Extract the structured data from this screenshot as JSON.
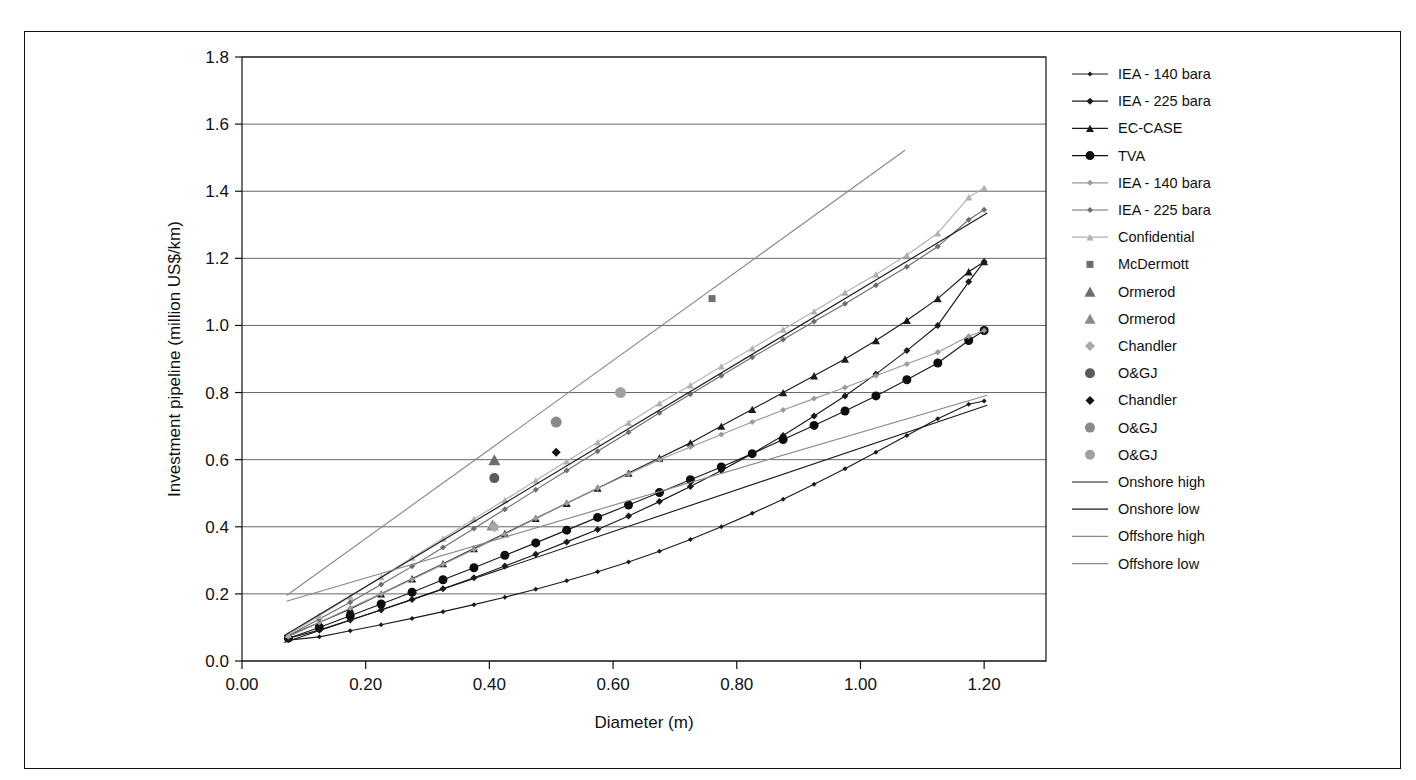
{
  "chart_data": {
    "type": "line",
    "title": "",
    "xlabel": "Diameter (m)",
    "ylabel": "Investment pipeline (million US$/km)",
    "xlim": [
      0.0,
      1.3
    ],
    "ylim": [
      0.0,
      1.8
    ],
    "xticks": [
      "0.00",
      "0.20",
      "0.40",
      "0.60",
      "0.80",
      "1.00",
      "1.20"
    ],
    "xtick_values": [
      0.0,
      0.2,
      0.4,
      0.6,
      0.8,
      1.0,
      1.2
    ],
    "yticks": [
      "0.0",
      "0.2",
      "0.4",
      "0.6",
      "0.8",
      "1.0",
      "1.2",
      "1.4",
      "1.6",
      "1.8"
    ],
    "ytick_values": [
      0.0,
      0.2,
      0.4,
      0.6,
      0.8,
      1.0,
      1.2,
      1.4,
      1.6,
      1.8
    ],
    "grid": "horizontal",
    "legend_position": "right",
    "series": [
      {
        "name": "IEA - 140 bara",
        "style": "line-marker",
        "marker": "diamond",
        "marker_size": 5,
        "color": "#1a1a1a",
        "line_color": "#1a1a1a",
        "x": [
          0.075,
          0.125,
          0.175,
          0.225,
          0.275,
          0.325,
          0.375,
          0.425,
          0.475,
          0.525,
          0.575,
          0.625,
          0.675,
          0.725,
          0.775,
          0.825,
          0.875,
          0.925,
          0.975,
          1.025,
          1.075,
          1.125,
          1.175,
          1.2
        ],
        "y": [
          0.062,
          0.072,
          0.09,
          0.108,
          0.127,
          0.147,
          0.168,
          0.19,
          0.214,
          0.239,
          0.266,
          0.295,
          0.327,
          0.362,
          0.4,
          0.44,
          0.482,
          0.527,
          0.573,
          0.622,
          0.672,
          0.722,
          0.765,
          0.775
        ]
      },
      {
        "name": "IEA - 225 bara",
        "style": "line-marker",
        "marker": "diamond",
        "marker_size": 7,
        "color": "#1a1a1a",
        "line_color": "#1a1a1a",
        "x": [
          0.075,
          0.125,
          0.175,
          0.225,
          0.275,
          0.325,
          0.375,
          0.425,
          0.475,
          0.525,
          0.575,
          0.625,
          0.675,
          0.725,
          0.775,
          0.825,
          0.875,
          0.925,
          0.975,
          1.025,
          1.075,
          1.125,
          1.175,
          1.2
        ],
        "y": [
          0.068,
          0.092,
          0.122,
          0.152,
          0.183,
          0.215,
          0.248,
          0.283,
          0.318,
          0.355,
          0.392,
          0.432,
          0.475,
          0.52,
          0.568,
          0.618,
          0.672,
          0.73,
          0.79,
          0.855,
          0.925,
          1.0,
          1.13,
          1.19
        ]
      },
      {
        "name": "EC-CASE",
        "style": "line-marker",
        "marker": "triangle",
        "marker_size": 8,
        "color": "#1a1a1a",
        "line_color": "#1a1a1a",
        "x": [
          0.075,
          0.125,
          0.175,
          0.225,
          0.275,
          0.325,
          0.375,
          0.425,
          0.475,
          0.525,
          0.575,
          0.625,
          0.675,
          0.725,
          0.775,
          0.825,
          0.875,
          0.925,
          0.975,
          1.025,
          1.075,
          1.125,
          1.175,
          1.2
        ],
        "y": [
          0.075,
          0.115,
          0.155,
          0.2,
          0.245,
          0.29,
          0.335,
          0.38,
          0.425,
          0.47,
          0.515,
          0.56,
          0.605,
          0.65,
          0.7,
          0.75,
          0.8,
          0.85,
          0.9,
          0.955,
          1.015,
          1.08,
          1.16,
          1.19
        ]
      },
      {
        "name": "TVA",
        "style": "line-marker",
        "marker": "circle",
        "marker_size": 9,
        "color": "#0d0d0d",
        "line_color": "#1a1a1a",
        "x": [
          0.075,
          0.125,
          0.175,
          0.225,
          0.275,
          0.325,
          0.375,
          0.425,
          0.475,
          0.525,
          0.575,
          0.625,
          0.675,
          0.725,
          0.775,
          0.825,
          0.875,
          0.925,
          0.975,
          1.025,
          1.075,
          1.125,
          1.175,
          1.2
        ],
        "y": [
          0.068,
          0.1,
          0.135,
          0.17,
          0.205,
          0.242,
          0.278,
          0.315,
          0.352,
          0.39,
          0.428,
          0.465,
          0.502,
          0.54,
          0.578,
          0.618,
          0.66,
          0.702,
          0.745,
          0.79,
          0.838,
          0.888,
          0.955,
          0.985
        ]
      },
      {
        "name": "IEA - 140 bara",
        "style": "line-marker",
        "marker": "diamond",
        "marker_size": 6,
        "color": "#9a9a9a",
        "line_color": "#9a9a9a",
        "x": [
          0.075,
          0.125,
          0.175,
          0.225,
          0.275,
          0.325,
          0.375,
          0.425,
          0.475,
          0.525,
          0.575,
          0.625,
          0.675,
          0.725,
          0.775,
          0.825,
          0.875,
          0.925,
          0.975,
          1.025,
          1.075,
          1.125,
          1.175,
          1.2
        ],
        "y": [
          0.072,
          0.115,
          0.158,
          0.2,
          0.243,
          0.288,
          0.332,
          0.378,
          0.425,
          0.47,
          0.515,
          0.557,
          0.6,
          0.638,
          0.675,
          0.712,
          0.748,
          0.782,
          0.815,
          0.85,
          0.885,
          0.92,
          0.968,
          0.985
        ]
      },
      {
        "name": "IEA - 225 bara",
        "style": "line-marker",
        "marker": "diamond",
        "marker_size": 6,
        "color": "#6e6e6e",
        "line_color": "#6e6e6e",
        "x": [
          0.075,
          0.125,
          0.175,
          0.225,
          0.275,
          0.325,
          0.375,
          0.425,
          0.475,
          0.525,
          0.575,
          0.625,
          0.675,
          0.725,
          0.775,
          0.825,
          0.875,
          0.925,
          0.975,
          1.025,
          1.075,
          1.125,
          1.175,
          1.2
        ],
        "y": [
          0.075,
          0.125,
          0.175,
          0.228,
          0.282,
          0.338,
          0.395,
          0.452,
          0.51,
          0.568,
          0.625,
          0.682,
          0.74,
          0.795,
          0.85,
          0.905,
          0.958,
          1.012,
          1.065,
          1.12,
          1.175,
          1.235,
          1.315,
          1.345
        ]
      },
      {
        "name": "Confidential",
        "style": "line-marker",
        "marker": "triangle",
        "marker_size": 7,
        "color": "#b0b0b0",
        "line_color": "#b0b0b0",
        "x": [
          0.075,
          0.125,
          0.175,
          0.225,
          0.275,
          0.325,
          0.375,
          0.425,
          0.475,
          0.525,
          0.575,
          0.625,
          0.675,
          0.725,
          0.775,
          0.825,
          0.875,
          0.925,
          0.975,
          1.025,
          1.075,
          1.125,
          1.175,
          1.2
        ],
        "y": [
          0.078,
          0.135,
          0.192,
          0.25,
          0.308,
          0.365,
          0.423,
          0.48,
          0.538,
          0.595,
          0.652,
          0.71,
          0.768,
          0.822,
          0.878,
          0.932,
          0.988,
          1.042,
          1.098,
          1.152,
          1.21,
          1.275,
          1.382,
          1.41
        ]
      },
      {
        "name": "McDermott",
        "style": "scatter",
        "marker": "square",
        "marker_size": 7,
        "color": "#6e6e6e",
        "x": [
          0.76
        ],
        "y": [
          1.08
        ]
      },
      {
        "name": "Ormerod",
        "style": "scatter",
        "marker": "triangle",
        "marker_size": 12,
        "color": "#6e6e6e",
        "x": [
          0.408
        ],
        "y": [
          0.6
        ]
      },
      {
        "name": "Ormerod",
        "style": "scatter",
        "marker": "triangle",
        "marker_size": 12,
        "color": "#8a8a8a",
        "x": [
          0.405
        ],
        "y": [
          0.405
        ]
      },
      {
        "name": "Chandler",
        "style": "scatter",
        "marker": "diamond",
        "marker_size": 11,
        "color": "#a8a8a8",
        "x": [
          0.408
        ],
        "y": [
          0.4
        ]
      },
      {
        "name": "O&GJ",
        "style": "scatter",
        "marker": "circle",
        "marker_size": 10,
        "color": "#5a5a5a",
        "x": [
          0.408
        ],
        "y": [
          0.545
        ]
      },
      {
        "name": "Chandler",
        "style": "scatter",
        "marker": "diamond",
        "marker_size": 9,
        "color": "#111111",
        "x": [
          0.508
        ],
        "y": [
          0.622
        ]
      },
      {
        "name": "O&GJ",
        "style": "scatter",
        "marker": "circle",
        "marker_size": 11,
        "color": "#8a8a8a",
        "x": [
          0.508
        ],
        "y": [
          0.712
        ]
      },
      {
        "name": "O&GJ",
        "style": "scatter",
        "marker": "circle",
        "marker_size": 11,
        "color": "#a0a0a0",
        "x": [
          0.612
        ],
        "y": [
          0.8
        ]
      },
      {
        "name": "Onshore high",
        "style": "line",
        "marker": "none",
        "color": "#1a1a1a",
        "line_color": "#1a1a1a",
        "x": [
          0.068,
          1.205
        ],
        "y": [
          0.075,
          1.335
        ]
      },
      {
        "name": "Onshore low",
        "style": "line",
        "marker": "none",
        "color": "#1a1a1a",
        "line_color": "#1a1a1a",
        "x": [
          0.068,
          1.205
        ],
        "y": [
          0.055,
          0.762
        ]
      },
      {
        "name": "Offshore high",
        "style": "line",
        "marker": "none",
        "color": "#8a8a8a",
        "line_color": "#8a8a8a",
        "x": [
          0.072,
          1.072
        ],
        "y": [
          0.195,
          1.522
        ]
      },
      {
        "name": "Offshore low",
        "style": "line",
        "marker": "none",
        "color": "#8a8a8a",
        "line_color": "#8a8a8a",
        "x": [
          0.072,
          1.205
        ],
        "y": [
          0.178,
          0.792
        ]
      }
    ],
    "legend": [
      {
        "label": "IEA - 140 bara",
        "type": "line-marker",
        "marker": "diamond",
        "size": 5,
        "color": "#1a1a1a"
      },
      {
        "label": "IEA - 225 bara",
        "type": "line-marker",
        "marker": "diamond",
        "size": 7,
        "color": "#1a1a1a"
      },
      {
        "label": "EC-CASE",
        "type": "line-marker",
        "marker": "triangle",
        "size": 8,
        "color": "#1a1a1a"
      },
      {
        "label": "TVA",
        "type": "line-marker",
        "marker": "circle",
        "size": 9,
        "color": "#0d0d0d"
      },
      {
        "label": "IEA - 140 bara",
        "type": "line-marker",
        "marker": "diamond",
        "size": 6,
        "color": "#9a9a9a"
      },
      {
        "label": "IEA - 225 bara",
        "type": "line-marker",
        "marker": "diamond",
        "size": 6,
        "color": "#6e6e6e"
      },
      {
        "label": "Confidential",
        "type": "line-marker",
        "marker": "triangle",
        "size": 7,
        "color": "#b0b0b0"
      },
      {
        "label": "McDermott",
        "type": "marker",
        "marker": "square",
        "size": 7,
        "color": "#6e6e6e"
      },
      {
        "label": "Ormerod",
        "type": "marker",
        "marker": "triangle",
        "size": 11,
        "color": "#6e6e6e"
      },
      {
        "label": "Ormerod",
        "type": "marker",
        "marker": "triangle",
        "size": 11,
        "color": "#8a8a8a"
      },
      {
        "label": "Chandler",
        "type": "marker",
        "marker": "diamond",
        "size": 10,
        "color": "#a8a8a8"
      },
      {
        "label": "O&GJ",
        "type": "marker",
        "marker": "circle",
        "size": 10,
        "color": "#5a5a5a"
      },
      {
        "label": "Chandler",
        "type": "marker",
        "marker": "diamond",
        "size": 9,
        "color": "#111111"
      },
      {
        "label": "O&GJ",
        "type": "marker",
        "marker": "circle",
        "size": 10,
        "color": "#8a8a8a"
      },
      {
        "label": "O&GJ",
        "type": "marker",
        "marker": "circle",
        "size": 10,
        "color": "#a0a0a0"
      },
      {
        "label": "Onshore high",
        "type": "line",
        "marker": "none",
        "size": 0,
        "color": "#1a1a1a"
      },
      {
        "label": "Onshore low",
        "type": "line",
        "marker": "none",
        "size": 0,
        "color": "#1a1a1a"
      },
      {
        "label": "Offshore high",
        "type": "line",
        "marker": "none",
        "size": 0,
        "color": "#8a8a8a"
      },
      {
        "label": "Offshore low",
        "type": "line",
        "marker": "none",
        "size": 0,
        "color": "#8a8a8a"
      }
    ]
  },
  "colors": {
    "frame": "#111111",
    "grid": "#555555",
    "background": "#ffffff"
  }
}
